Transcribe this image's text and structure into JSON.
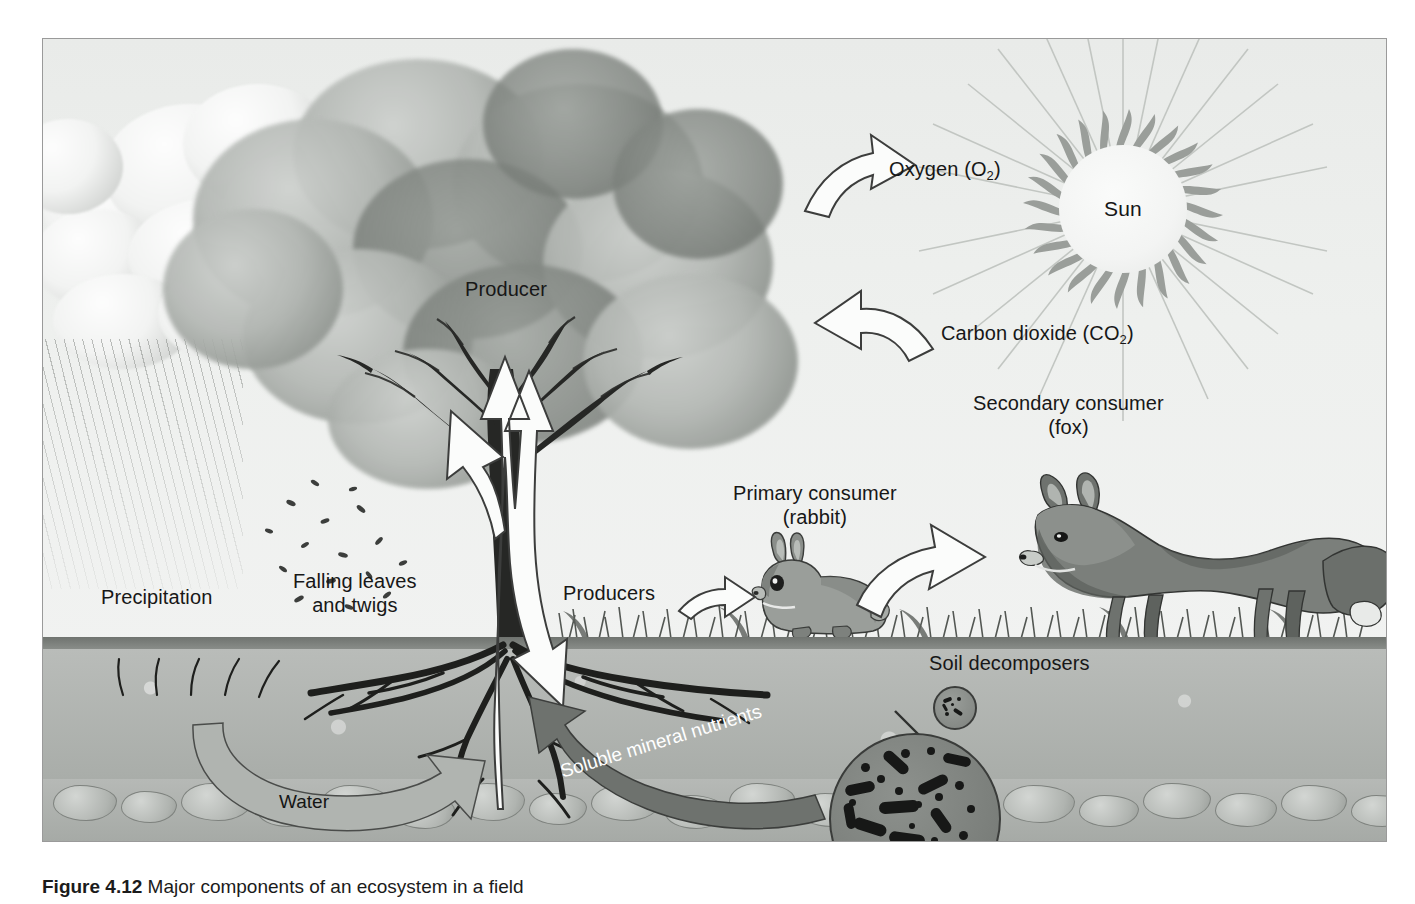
{
  "figure": {
    "caption_label": "Figure 4.12",
    "caption_text": "Major components of an ecosystem in a field"
  },
  "sky": {
    "sun_label": "Sun"
  },
  "labels": {
    "oxygen": "Oxygen (O",
    "oxygen_sub": "2",
    "oxygen_close": ")",
    "carbon_dioxide": "Carbon dioxide (CO",
    "carbon_dioxide_sub": "2",
    "carbon_dioxide_close": ")",
    "producer": "Producer",
    "producers": "Producers",
    "precipitation": "Precipitation",
    "falling_leaves_line1": "Falling leaves",
    "falling_leaves_line2": "and twigs",
    "primary_consumer_line1": "Primary consumer",
    "primary_consumer_line2": "(rabbit)",
    "secondary_consumer_line1": "Secondary consumer",
    "secondary_consumer_line2": "(fox)",
    "soil_decomposers": "Soil decomposers",
    "water": "Water",
    "soluble_mineral_nutrients": "Soluble mineral nutrients"
  },
  "colors": {
    "frame_bg": "#eceeec",
    "frame_border": "#9a9a9a",
    "sun_ray": "#9a9e9a",
    "arrow_fill": "#fbfcfb",
    "arrow_stroke": "#3c3d3c",
    "water_arrow": "#b0b4b0",
    "nutrient_arrow": "#6e726e",
    "soil": "#b9bcb9",
    "text": "#171717"
  },
  "diagram": {
    "type": "ecosystem-flow",
    "components": [
      "Sun",
      "Producer (tree)",
      "Producers (grass)",
      "Primary consumer (rabbit)",
      "Secondary consumer (fox)",
      "Soil decomposers",
      "Precipitation",
      "Soil / rock layer"
    ],
    "flows": [
      {
        "label": "Oxygen (O2)",
        "from": "tree",
        "to": "atmosphere",
        "direction": "right"
      },
      {
        "label": "Carbon dioxide (CO2)",
        "from": "atmosphere",
        "to": "tree",
        "direction": "left"
      },
      {
        "label": "Falling leaves and twigs",
        "from": "tree",
        "to": "soil",
        "direction": "down"
      },
      {
        "label": "Water",
        "from": "soil",
        "to": "tree roots",
        "direction": "curved-right"
      },
      {
        "label": "Soluble mineral nutrients",
        "from": "decomposers",
        "to": "tree roots",
        "direction": "curved-left"
      },
      {
        "label": "Producers",
        "from": "grass",
        "to": "rabbit",
        "direction": "right"
      },
      {
        "label": "Primary consumer",
        "from": "rabbit",
        "to": "fox",
        "direction": "right"
      },
      {
        "label": "Uptake",
        "from": "roots",
        "to": "canopy",
        "direction": "up"
      }
    ]
  }
}
